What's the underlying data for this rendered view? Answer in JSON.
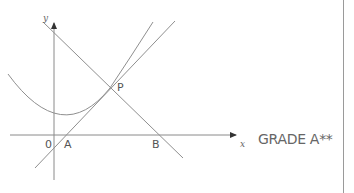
{
  "diagram": {
    "axes": {
      "x_label": "x",
      "y_label": "y"
    },
    "points": {
      "origin": "0",
      "A": "A",
      "B": "B",
      "P": "P"
    },
    "annotation": "GRADE A**",
    "elements": [
      {
        "type": "curve",
        "description": "U-shaped curve (parabola) with minimum left of A, passing through P"
      },
      {
        "type": "line",
        "description": "line with positive gradient through A and P"
      },
      {
        "type": "line",
        "description": "line with negative gradient through P and B, crossing y-axis"
      }
    ],
    "colors": {
      "stroke": "#8c8c8c",
      "text": "#555555"
    }
  }
}
